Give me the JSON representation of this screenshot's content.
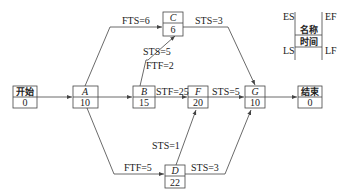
{
  "diagram": {
    "type": "precedence-network",
    "nodes": {
      "start": {
        "name": "开始",
        "duration": "0"
      },
      "A": {
        "name": "A",
        "duration": "10"
      },
      "B": {
        "name": "B",
        "duration": "15"
      },
      "C": {
        "name": "C",
        "duration": "6"
      },
      "D": {
        "name": "D",
        "duration": "22"
      },
      "F": {
        "name": "F",
        "duration": "20"
      },
      "G": {
        "name": "G",
        "duration": "10"
      },
      "end": {
        "name": "结束",
        "duration": "0"
      }
    },
    "edges": {
      "a_c": "FTS=6",
      "c_g": "STS=3",
      "b_c_sts": "STS=5",
      "b_c_ftf": "FTF=2",
      "b_f": "STF=25",
      "f_g": "STS=5",
      "d_f": "STS=1",
      "a_d": "FTF=5",
      "d_g": "STS=3"
    },
    "legend": {
      "es": "ES",
      "ef": "EF",
      "ls": "LS",
      "lf": "LF",
      "name": "名称",
      "time": "时间"
    }
  }
}
